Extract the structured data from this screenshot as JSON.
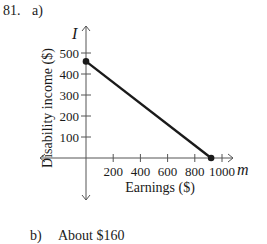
{
  "problem": {
    "number": "81.",
    "part_a_label": "a)",
    "part_b_label": "b)",
    "part_b_answer": "About $160"
  },
  "chart_data": {
    "type": "line",
    "title": "",
    "xlabel": "Earnings ($)",
    "ylabel": "Disability income ($)",
    "x_axis_var": "m",
    "y_axis_var": "I",
    "xlim": [
      0,
      1000
    ],
    "ylim": [
      0,
      500
    ],
    "x_ticks": [
      200,
      400,
      600,
      800,
      1000
    ],
    "y_ticks": [
      100,
      200,
      300,
      400,
      500
    ],
    "x_tick_labels": [
      "200",
      "400",
      "600",
      "800",
      "1000"
    ],
    "y_tick_labels": [
      "100",
      "200",
      "300",
      "400",
      "500"
    ],
    "grid": false,
    "series": [
      {
        "name": "I",
        "x": [
          0,
          920
        ],
        "y": [
          460,
          0
        ],
        "color": "#1a1a1a",
        "endpoints": "filled-dots"
      }
    ]
  }
}
